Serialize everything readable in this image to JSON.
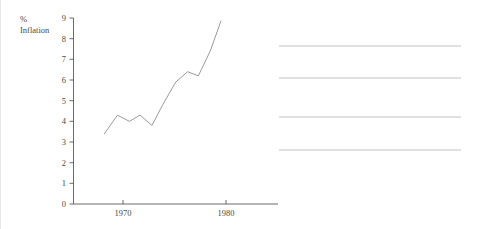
{
  "chart_data": {
    "type": "line",
    "title": "",
    "subtitle": "",
    "xlabel": "",
    "ylabel": "% Inflation",
    "ylabel_lines": [
      "%",
      "Inflation"
    ],
    "xlim": [
      1967.6,
      1984.8
    ],
    "ylim": [
      0,
      9
    ],
    "grid": false,
    "legend": false,
    "legend_position": "none",
    "line_color": "#9a9a9a",
    "axis_color": "#5a5a5a",
    "rule_color": "#c2c2c2",
    "background_color": "#ffffff",
    "y_ticks": [
      0,
      1,
      2,
      3,
      4,
      5,
      6,
      7,
      8,
      9
    ],
    "y_tick_labels": [
      "0",
      "1",
      "2",
      "3",
      "4",
      "5",
      "6",
      "7",
      "8",
      "9"
    ],
    "x_ticks": [
      1970,
      1980
    ],
    "x_tick_labels": [
      "1970",
      "1980"
    ],
    "series": [
      {
        "name": "Inflation",
        "x": [
          1970.2,
          1971.3,
          1972.3,
          1973.2,
          1974.2,
          1975.1,
          1976.2,
          1977.2,
          1978.1,
          1979.1,
          1980.0
        ],
        "values": [
          3.4,
          4.3,
          4.0,
          4.3,
          3.8,
          4.8,
          5.9,
          6.4,
          6.2,
          7.4,
          8.85
        ]
      }
    ],
    "annotations": [],
    "right_rules": {
      "count": 4,
      "x_start": 278,
      "x_end": 460,
      "y_positions": [
        46,
        78,
        117,
        150
      ],
      "labels": [
        "",
        "",
        "",
        ""
      ]
    }
  }
}
